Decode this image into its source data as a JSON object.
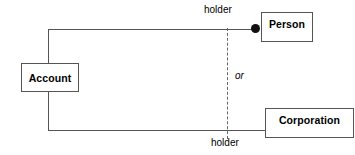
{
  "diagram": {
    "type": "uml-class-diagram",
    "classes": [
      {
        "id": "account",
        "name": "Account"
      },
      {
        "id": "person",
        "name": "Person"
      },
      {
        "id": "corporation",
        "name": "Corporation"
      }
    ],
    "associations": [
      {
        "id": "account-person",
        "from": "Account",
        "to": "Person",
        "role_label": "holder",
        "end_marker": "filled-dot"
      },
      {
        "id": "account-corporation",
        "from": "Account",
        "to": "Corporation",
        "role_label": "holder",
        "end_marker": "none"
      }
    ],
    "constraint": {
      "id": "xor",
      "label": "or",
      "style": "dashed"
    },
    "colors": {
      "background": "#ffffff",
      "line": "#555555",
      "dash": "#666666",
      "text": "#000000",
      "dot": "#111111"
    }
  }
}
